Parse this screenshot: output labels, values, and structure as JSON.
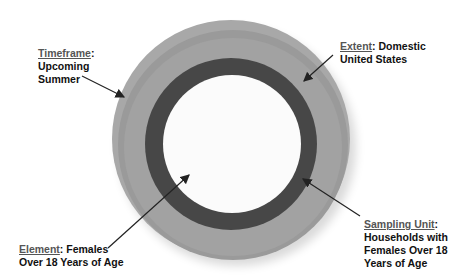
{
  "diagram": {
    "labels": {
      "timeframe": {
        "key": "Timeframe",
        "sep": ":",
        "value_lines": [
          "Upcoming",
          "Summer"
        ]
      },
      "extent": {
        "key": "Extent",
        "sep": ":",
        "value_first": " Domestic",
        "value_lines": [
          "United States"
        ]
      },
      "element": {
        "key": "Element",
        "sep": ":",
        "value_first": " Females",
        "value_lines": [
          "Over 18 Years of Age"
        ]
      },
      "sampling_unit": {
        "key": "Sampling Unit",
        "sep": ":",
        "value_lines": [
          "Households with",
          "Females Over 18",
          "Years of Age"
        ]
      }
    },
    "colors": {
      "outer_ring": "#a8a8a8",
      "dark_ring": "#474747",
      "inner_circle": "#fbfbfb",
      "text": "#111111",
      "key_text": "#555555"
    }
  }
}
